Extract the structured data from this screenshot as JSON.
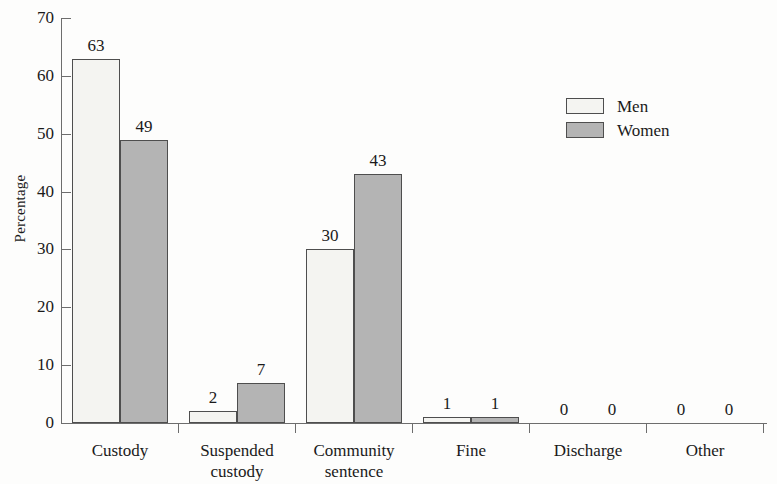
{
  "chart_data": {
    "type": "bar",
    "title": "",
    "xlabel": "",
    "ylabel": "Percentage",
    "ylim": [
      0,
      70
    ],
    "ytick_step": 10,
    "yticks": [
      0,
      10,
      20,
      30,
      40,
      50,
      60,
      70
    ],
    "ytick_labels": [
      "0",
      "10",
      "20",
      "30",
      "40",
      "50",
      "60",
      "70"
    ],
    "grid": false,
    "legend_position": "upper right",
    "categories": [
      "Custody",
      "Suspended custody",
      "Community sentence",
      "Fine",
      "Discharge",
      "Other"
    ],
    "category_lines": [
      [
        "Custody"
      ],
      [
        "Suspended",
        "custody"
      ],
      [
        "Community",
        "sentence"
      ],
      [
        "Fine"
      ],
      [
        "Discharge"
      ],
      [
        "Other"
      ]
    ],
    "series": [
      {
        "name": "Men",
        "color": "#f4f4f1",
        "values": [
          63,
          2,
          30,
          1,
          0,
          0
        ],
        "labels": [
          "63",
          "2",
          "30",
          "1",
          "0",
          "0"
        ]
      },
      {
        "name": "Women",
        "color": "#b4b4b4",
        "values": [
          49,
          7,
          43,
          1,
          0,
          0
        ],
        "labels": [
          "49",
          "7",
          "43",
          "1",
          "0",
          "0"
        ]
      }
    ]
  },
  "legend": {
    "entries": [
      {
        "label": "Men",
        "swatch": "men"
      },
      {
        "label": "Women",
        "swatch": "women"
      }
    ]
  }
}
